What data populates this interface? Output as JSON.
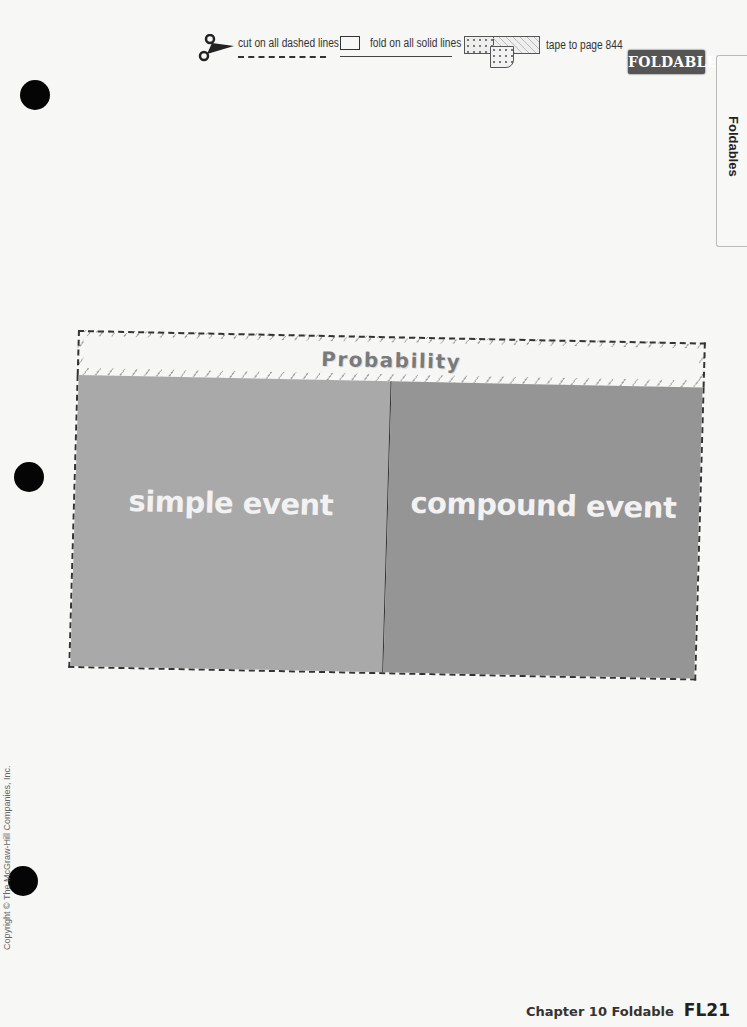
{
  "legend": {
    "cut_label": "cut on all dashed lines",
    "fold_label": "fold on all solid lines",
    "tape_label": "tape to page 844",
    "icons": [
      "scissors-icon",
      "fold-icon",
      "tape-icon"
    ]
  },
  "brand": {
    "logo_text": "FOLDABLES"
  },
  "side_tab": {
    "label": "Foldables"
  },
  "foldable": {
    "title": "Probability",
    "panels": [
      {
        "label": "simple event",
        "color": "#a9a9a9"
      },
      {
        "label": "compound event",
        "color": "#959595"
      }
    ]
  },
  "copyright": "Copyright © The McGraw-Hill Companies, Inc.",
  "footer": {
    "chapter_label": "Chapter 10 Foldable",
    "page_number": "FL21"
  }
}
